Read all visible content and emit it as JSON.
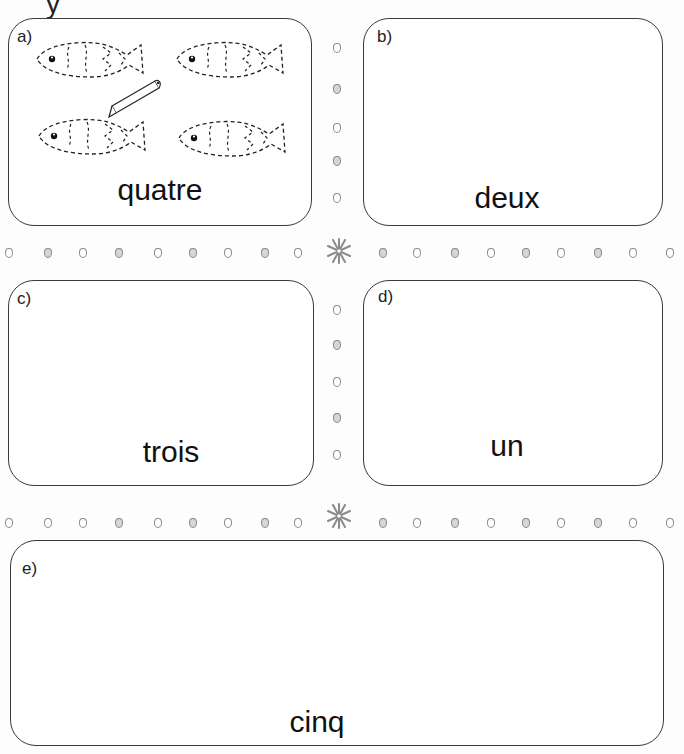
{
  "page": {
    "cutoff_text": "y"
  },
  "panels": [
    {
      "letter": "a)",
      "word": "quatre",
      "fish_count": 4,
      "has_pencil": true
    },
    {
      "letter": "b)",
      "word": "deux"
    },
    {
      "letter": "c)",
      "word": "trois"
    },
    {
      "letter": "d)",
      "word": "un"
    },
    {
      "letter": "e)",
      "word": "cinq"
    }
  ],
  "decorations": {
    "dot_color": "#8a8a8a",
    "dot_fill_alt": "#d6d6d6",
    "star_color": "#8a8a8a",
    "border_color": "#3a3a3a"
  }
}
